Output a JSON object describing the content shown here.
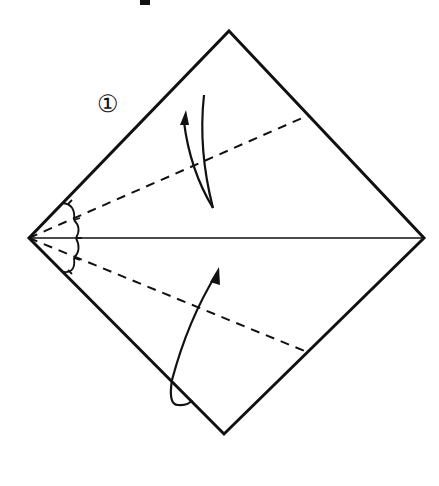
{
  "diagram": {
    "step_label": "①",
    "colors": {
      "ink": "#111111",
      "paper": "#ffffff"
    },
    "square": {
      "top": [
        229,
        31
      ],
      "right": [
        424,
        238
      ],
      "bottom": [
        224,
        434
      ],
      "left": [
        29,
        238
      ]
    },
    "center_line": {
      "from": [
        29,
        238
      ],
      "to": [
        424,
        238
      ],
      "style": "solid-thin"
    },
    "fold_lines": [
      {
        "name": "upper-valley-fold",
        "from": [
          29,
          238
        ],
        "to": [
          309,
          115
        ],
        "style": "dashed"
      },
      {
        "name": "lower-valley-fold",
        "from": [
          29,
          238
        ],
        "to": [
          307,
          352
        ],
        "style": "dashed"
      }
    ],
    "angle_marks": [
      "equal-angle-arc",
      "equal-angle-arc",
      "equal-angle-arc",
      "equal-angle-arc"
    ],
    "arrows": [
      {
        "name": "fold-arrow-upper",
        "direction": "fold edge down to center line"
      },
      {
        "name": "fold-arrow-lower",
        "direction": "fold edge up to center line"
      }
    ]
  }
}
